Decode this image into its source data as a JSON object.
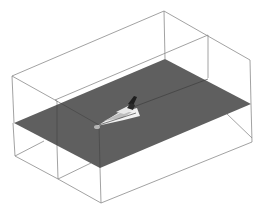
{
  "scene": {
    "description": "3D wireframe bounding box with a horizontal gray cutting plane and a shuttle model",
    "colors": {
      "background": "#ffffff",
      "plane": "#5f5f5f",
      "box_edges": "#8a8a8a",
      "model_light": "#f2f2f2",
      "model_dark": "#1e1e1e"
    },
    "objects": [
      {
        "name": "bounding-box",
        "type": "wireframe-box"
      },
      {
        "name": "cutting-plane",
        "type": "plane"
      },
      {
        "name": "shuttle-model",
        "type": "3d-model"
      }
    ]
  }
}
